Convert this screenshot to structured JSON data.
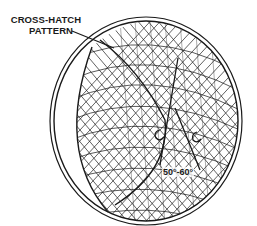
{
  "figure": {
    "callout": {
      "line1": "CROSS-HATCH",
      "line2": "PATTERN"
    },
    "angle_annotation": "50°-60°",
    "colors": {
      "ink": "#1a1a1a",
      "background": "#ffffff"
    }
  }
}
